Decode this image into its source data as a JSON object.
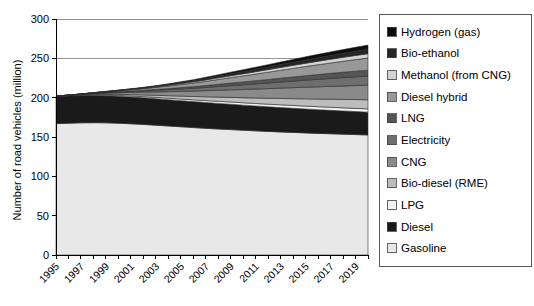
{
  "chart_data": {
    "type": "area",
    "title": "",
    "xlabel": "",
    "ylabel": "Number of road vehicles (million)",
    "ylim": [
      0,
      300
    ],
    "yticks": [
      0,
      50,
      100,
      150,
      200,
      250,
      300
    ],
    "xlim": [
      1995,
      2020
    ],
    "grid": true,
    "stacked": true,
    "legend_position": "right",
    "x": [
      1995,
      1996,
      1997,
      1998,
      1999,
      2000,
      2001,
      2002,
      2003,
      2004,
      2005,
      2006,
      2007,
      2008,
      2009,
      2010,
      2011,
      2012,
      2013,
      2014,
      2015,
      2016,
      2017,
      2018,
      2019,
      2020
    ],
    "xtick_labels": [
      "1995",
      "1997",
      "1999",
      "2001",
      "2003",
      "2005",
      "2007",
      "2009",
      "2011",
      "2013",
      "2015",
      "2017",
      "2019"
    ],
    "series": [
      {
        "name": "Gasoline",
        "color": "#e8e8e8",
        "values": [
          167,
          167.5,
          168,
          168.2,
          168,
          167.5,
          166.8,
          166,
          165,
          164,
          163,
          162,
          161,
          160.2,
          159.4,
          158.6,
          157.8,
          157.1,
          156.4,
          155.8,
          155.2,
          154.6,
          154.1,
          153.6,
          153.1,
          152.6
        ]
      },
      {
        "name": "Diesel",
        "color": "#1a1a1a",
        "values": [
          34.5,
          34.6,
          34.6,
          34.5,
          34.4,
          34.2,
          34.0,
          33.8,
          33.6,
          33.4,
          33.2,
          33.0,
          32.8,
          32.5,
          32.2,
          31.9,
          31.6,
          31.3,
          31.0,
          30.7,
          30.4,
          30.1,
          29.8,
          29.5,
          29.2,
          29.0
        ]
      },
      {
        "name": "LPG",
        "color": "#f2f2f2",
        "values": [
          0.3,
          0.4,
          0.5,
          0.7,
          0.9,
          1.1,
          1.3,
          1.5,
          1.7,
          1.9,
          2.1,
          2.3,
          2.5,
          2.7,
          2.9,
          3.0,
          3.2,
          3.3,
          3.5,
          3.6,
          3.7,
          3.8,
          3.9,
          4.0,
          4.1,
          4.2
        ]
      },
      {
        "name": "Bio-diesel (RME)",
        "color": "#bdbdbd",
        "values": [
          0.1,
          0.2,
          0.4,
          0.7,
          1.0,
          1.4,
          1.8,
          2.2,
          2.7,
          3.2,
          3.7,
          4.2,
          4.8,
          5.3,
          5.9,
          6.4,
          7.0,
          7.5,
          8.1,
          8.6,
          9.2,
          9.7,
          10.2,
          10.7,
          11.2,
          11.6
        ]
      },
      {
        "name": "CNG",
        "color": "#8a8a8a",
        "values": [
          0.1,
          0.3,
          0.6,
          1.0,
          1.5,
          2.1,
          2.8,
          3.5,
          4.3,
          5.1,
          6.0,
          6.9,
          7.8,
          8.7,
          9.6,
          10.5,
          11.4,
          12.3,
          13.2,
          14.0,
          14.8,
          15.6,
          16.4,
          17.1,
          17.8,
          18.5
        ]
      },
      {
        "name": "Electricity",
        "color": "#6e6e6e",
        "values": [
          0.0,
          0.1,
          0.2,
          0.4,
          0.6,
          0.9,
          1.2,
          1.6,
          2.0,
          2.5,
          3.0,
          3.5,
          4.1,
          4.7,
          5.3,
          5.9,
          6.5,
          7.1,
          7.7,
          8.3,
          8.9,
          9.5,
          10.0,
          10.6,
          11.1,
          11.6
        ]
      },
      {
        "name": "LNG",
        "color": "#555555",
        "values": [
          0.0,
          0.05,
          0.1,
          0.2,
          0.35,
          0.5,
          0.7,
          0.9,
          1.2,
          1.5,
          1.8,
          2.1,
          2.5,
          2.9,
          3.3,
          3.7,
          4.1,
          4.5,
          4.9,
          5.3,
          5.7,
          6.1,
          6.5,
          6.8,
          7.2,
          7.5
        ]
      },
      {
        "name": "Diesel hybrid",
        "color": "#989898",
        "values": [
          0.0,
          0.1,
          0.2,
          0.4,
          0.7,
          1.1,
          1.5,
          2.0,
          2.6,
          3.2,
          3.9,
          4.6,
          5.3,
          6.1,
          6.9,
          7.7,
          8.5,
          9.3,
          10.1,
          10.9,
          11.7,
          12.5,
          13.2,
          14.0,
          14.7,
          15.4
        ]
      },
      {
        "name": "Methanol (from CNG)",
        "color": "#d4d4d4",
        "values": [
          0.0,
          0.0,
          0.05,
          0.1,
          0.2,
          0.3,
          0.45,
          0.6,
          0.8,
          1.0,
          1.2,
          1.5,
          1.8,
          2.1,
          2.4,
          2.7,
          3.0,
          3.3,
          3.6,
          3.9,
          4.2,
          4.5,
          4.8,
          5.0,
          5.3,
          5.5
        ]
      },
      {
        "name": "Bio-ethanol",
        "color": "#262626",
        "values": [
          0.0,
          0.0,
          0.05,
          0.1,
          0.2,
          0.3,
          0.45,
          0.6,
          0.8,
          1.0,
          1.3,
          1.5,
          1.8,
          2.1,
          2.4,
          2.7,
          3.0,
          3.3,
          3.6,
          3.9,
          4.2,
          4.5,
          4.8,
          5.0,
          5.3,
          5.5
        ]
      },
      {
        "name": "Hydrogen (gas)",
        "color": "#0d0d0d",
        "values": [
          0.0,
          0.0,
          0.0,
          0.05,
          0.1,
          0.2,
          0.3,
          0.4,
          0.6,
          0.8,
          1.0,
          1.2,
          1.5,
          1.8,
          2.1,
          2.4,
          2.7,
          3.0,
          3.3,
          3.6,
          3.9,
          4.2,
          4.5,
          4.8,
          5.1,
          5.4
        ]
      }
    ],
    "totals": [
      202,
      203.2,
      204.7,
      206.4,
      207.9,
      209.6,
      211.3,
      213.1,
      215.3,
      217.6,
      220.2,
      222.8,
      225.9,
      229.1,
      232.4,
      235.5,
      238.8,
      241.7,
      245.4,
      248.6,
      251.9,
      255.1,
      258.2,
      261.1,
      264.0,
      266.8
    ]
  },
  "axes": {
    "y_title": "Number of road vehicles (million)",
    "y_tick_labels": [
      "300",
      "250",
      "200",
      "150",
      "100",
      "50",
      "0"
    ],
    "x_tick_labels": [
      "1995",
      "1997",
      "1999",
      "2001",
      "2003",
      "2005",
      "2007",
      "2009",
      "2011",
      "2013",
      "2015",
      "2017",
      "2019"
    ]
  },
  "legend": {
    "items": [
      {
        "label": "Hydrogen (gas)",
        "color": "#0d0d0d"
      },
      {
        "label": "Bio-ethanol",
        "color": "#262626"
      },
      {
        "label": "Methanol (from CNG)",
        "color": "#d4d4d4"
      },
      {
        "label": "Diesel hybrid",
        "color": "#989898"
      },
      {
        "label": "LNG",
        "color": "#555555"
      },
      {
        "label": "Electricity",
        "color": "#6e6e6e"
      },
      {
        "label": "CNG",
        "color": "#8a8a8a"
      },
      {
        "label": "Bio-diesel (RME)",
        "color": "#bdbdbd"
      },
      {
        "label": "LPG",
        "color": "#f2f2f2"
      },
      {
        "label": "Diesel",
        "color": "#1a1a1a"
      },
      {
        "label": "Gasoline",
        "color": "#e8e8e8"
      }
    ]
  }
}
